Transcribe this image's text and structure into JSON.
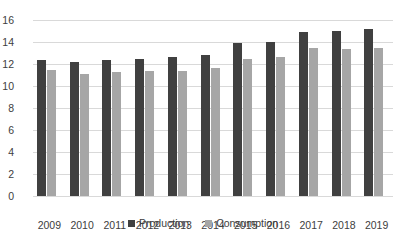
{
  "chart_data": {
    "type": "bar",
    "title": "",
    "subtitle": "",
    "xlabel": "",
    "ylabel": "",
    "categories": [
      "2009",
      "2010",
      "2011",
      "2012",
      "2013",
      "2014",
      "2015",
      "2016",
      "2017",
      "2018",
      "2019"
    ],
    "series": [
      {
        "name": "Production",
        "color": "#404040",
        "values": [
          12.4,
          12.2,
          12.4,
          12.5,
          12.6,
          12.8,
          13.9,
          14.0,
          14.9,
          15.0,
          15.2
        ]
      },
      {
        "name": "Consumption",
        "color": "#a6a6a6",
        "values": [
          11.5,
          11.1,
          11.3,
          11.4,
          11.4,
          11.6,
          12.5,
          12.6,
          13.5,
          13.4,
          13.5
        ]
      }
    ],
    "ylim": [
      0,
      16
    ],
    "yticks": [
      0,
      2,
      4,
      6,
      8,
      10,
      12,
      14,
      16
    ],
    "ytick_labels": [
      "0",
      "2",
      "4",
      "6",
      "8",
      "10",
      "12",
      "14",
      "16"
    ],
    "grid": true,
    "grid_axis": "y",
    "legend_position": "bottom",
    "legend": [
      "Production",
      "Consumption"
    ]
  },
  "colors": {
    "gridline": "#d9d9d9",
    "text": "#404040",
    "background": "#ffffff"
  }
}
